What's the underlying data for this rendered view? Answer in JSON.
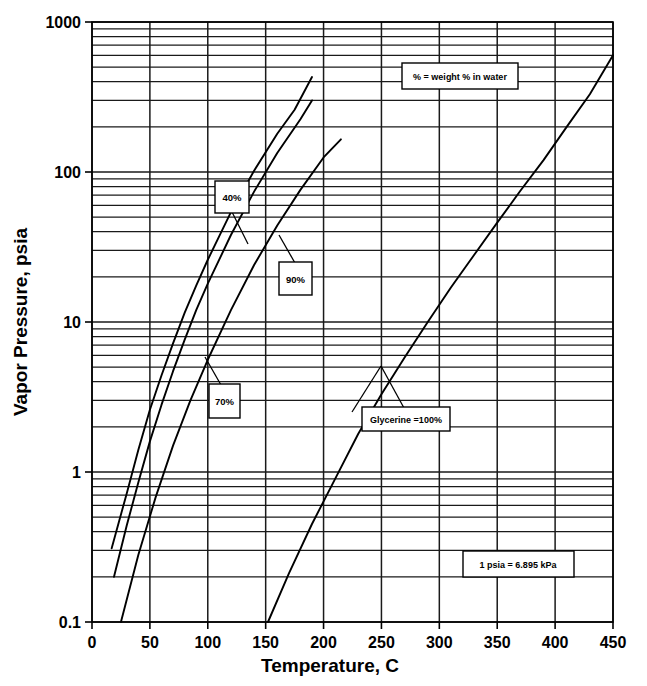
{
  "chart_data": {
    "type": "line",
    "title": "",
    "xlabel": "Temperature, C",
    "ylabel": "Vapor Pressure, psia",
    "xlim": [
      0,
      450
    ],
    "ylim": [
      0.1,
      1000
    ],
    "yscale": "log",
    "xscale": "linear",
    "grid": true,
    "grid_minor_y": true,
    "legend": "inline-callout-boxes",
    "xticks": [
      "0",
      "50",
      "100",
      "150",
      "200",
      "250",
      "300",
      "350",
      "400",
      "450"
    ],
    "xtick_values": [
      0,
      50,
      100,
      150,
      200,
      250,
      300,
      350,
      400,
      450
    ],
    "yticks": [
      "0.1",
      "1",
      "10",
      "100",
      "1000"
    ],
    "ytick_values": [
      0.1,
      1,
      10,
      100,
      1000
    ],
    "series": [
      {
        "name": "40%",
        "label": "40%",
        "points": [
          [
            17,
            0.31
          ],
          [
            30,
            0.72
          ],
          [
            40,
            1.4
          ],
          [
            50,
            2.6
          ],
          [
            60,
            4.4
          ],
          [
            70,
            7.2
          ],
          [
            80,
            11.5
          ],
          [
            90,
            17.5
          ],
          [
            100,
            26
          ],
          [
            120,
            54
          ],
          [
            140,
            102
          ],
          [
            160,
            180
          ],
          [
            175,
            260
          ],
          [
            190,
            430
          ]
        ]
      },
      {
        "name": "70%",
        "label": "70%",
        "points": [
          [
            19,
            0.2
          ],
          [
            30,
            0.44
          ],
          [
            40,
            0.85
          ],
          [
            50,
            1.6
          ],
          [
            60,
            2.8
          ],
          [
            70,
            4.7
          ],
          [
            80,
            7.6
          ],
          [
            90,
            12
          ],
          [
            100,
            18
          ],
          [
            120,
            38
          ],
          [
            140,
            74
          ],
          [
            160,
            134
          ],
          [
            180,
            225
          ],
          [
            190,
            300
          ]
        ]
      },
      {
        "name": "90%",
        "label": "90%",
        "points": [
          [
            25,
            0.1
          ],
          [
            40,
            0.28
          ],
          [
            55,
            0.68
          ],
          [
            70,
            1.5
          ],
          [
            85,
            3.0
          ],
          [
            100,
            5.6
          ],
          [
            120,
            12
          ],
          [
            140,
            24
          ],
          [
            160,
            44
          ],
          [
            180,
            76
          ],
          [
            200,
            125
          ],
          [
            215,
            165
          ]
        ]
      },
      {
        "name": "Glycerine =100%",
        "label": "Glycerine =100%",
        "points": [
          [
            152,
            0.1
          ],
          [
            170,
            0.21
          ],
          [
            190,
            0.45
          ],
          [
            210,
            0.9
          ],
          [
            230,
            1.8
          ],
          [
            250,
            3.3
          ],
          [
            270,
            5.8
          ],
          [
            290,
            10
          ],
          [
            310,
            17
          ],
          [
            330,
            28
          ],
          [
            350,
            46
          ],
          [
            370,
            75
          ],
          [
            390,
            120
          ],
          [
            410,
            200
          ],
          [
            430,
            330
          ],
          [
            450,
            600
          ]
        ]
      }
    ],
    "annotations": [
      {
        "id": "note-weight-percent",
        "text": "% = weight % in water"
      },
      {
        "id": "note-psia-kpa",
        "text": "1 psia = 6.895 kPa"
      },
      {
        "id": "callout-40",
        "text": "40%"
      },
      {
        "id": "callout-70",
        "text": "70%"
      },
      {
        "id": "callout-90",
        "text": "90%"
      },
      {
        "id": "callout-glycerine",
        "text": "Glycerine =100%"
      }
    ]
  },
  "axes": {
    "y_title": "Vapor Pressure, psia",
    "x_title": "Temperature, C"
  },
  "colors": {
    "line": "#000000",
    "grid": "#1a1a1a",
    "background": "#ffffff",
    "text": "#000000"
  }
}
